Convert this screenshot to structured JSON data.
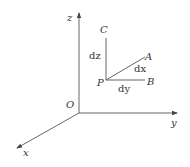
{
  "diagram": {
    "type": "3d-coordinate-system",
    "colors": {
      "line": "#555555",
      "text": "#333333",
      "background": "#ffffff"
    },
    "axes": {
      "origin_label": "O",
      "x_label": "x",
      "y_label": "y",
      "z_label": "z"
    },
    "points": {
      "P": "P",
      "A": "A",
      "B": "B",
      "C": "C"
    },
    "segments": {
      "PA": "dx",
      "PB": "dy",
      "PC": "dz"
    }
  }
}
